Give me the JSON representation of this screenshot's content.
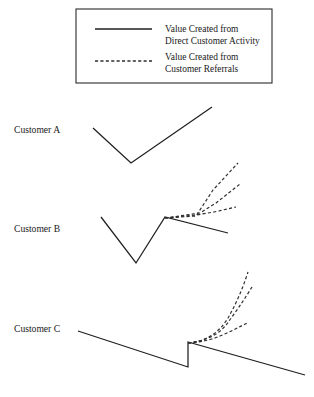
{
  "figure": {
    "width": 314,
    "height": 397,
    "background": "#ffffff",
    "line_color": "#1f1f1f",
    "dashed_color": "#2e2e2e",
    "border_color": "#2b2b2b"
  },
  "legend": {
    "box": {
      "x": 76,
      "y": 9,
      "width": 196,
      "height": 74
    },
    "entries": [
      {
        "style": "solid",
        "swatch_name": "legend-swatch-solid",
        "line1": "Value Created from",
        "line2": "Direct Customer Activity"
      },
      {
        "style": "dashed",
        "swatch_name": "legend-swatch-dashed",
        "line1": "Value Created from",
        "line2": "Customer Referrals"
      }
    ]
  },
  "rows": [
    {
      "id": "customer-a",
      "label": "Customer A",
      "label_x": 14,
      "label_y": 133,
      "solid_path": "M 93,128 L 131,163 L 212,107",
      "dashed_paths": []
    },
    {
      "id": "customer-b",
      "label": "Customer B",
      "label_x": 14,
      "label_y": 232,
      "solid_path": "M 101,217 L 136,263 L 165,217 L 228,233",
      "dashed_paths": [
        "M 165,218 L 196,216 L 213,190 L 238,163",
        "M 165,218 L 200,213 L 216,203 L 240,184",
        "M 165,218 L 196,215 L 214,212 L 236,207"
      ]
    },
    {
      "id": "customer-c",
      "label": "Customer C",
      "label_x": 14,
      "label_y": 332,
      "solid_path": "M 78,331 L 188,367 L 188,342 L 305,375",
      "dashed_paths": [
        "M 188,343 Q 214,341 228,318 Q 240,297 248,272",
        "M 188,343 Q 214,340 226,325 Q 239,308 252,287",
        "M 188,343 Q 206,342 220,336 Q 234,330 247,323"
      ]
    }
  ]
}
